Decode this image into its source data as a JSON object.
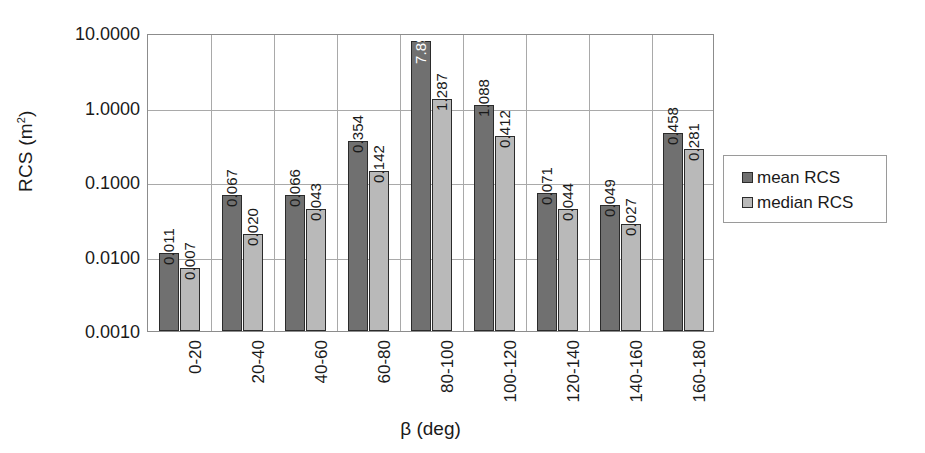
{
  "chart_data": {
    "type": "bar",
    "title": "",
    "xlabel": "β (deg)",
    "ylabel": "RCS (m²)",
    "yscale": "log",
    "ylim": [
      0.001,
      10.0
    ],
    "ytick_labels": [
      "10.0000",
      "1.0000",
      "0.1000",
      "0.0100",
      "0.0010"
    ],
    "ytick_values": [
      10.0,
      1.0,
      0.1,
      0.01,
      0.001
    ],
    "grid": true,
    "legend_position": "right",
    "categories": [
      "0-20",
      "20-40",
      "40-60",
      "60-80",
      "80-100",
      "100-120",
      "120-140",
      "140-160",
      "160-180"
    ],
    "series": [
      {
        "name": "mean RCS",
        "color": "#707070",
        "values": [
          0.011,
          0.067,
          0.066,
          0.354,
          7.895,
          1.088,
          0.071,
          0.049,
          0.458
        ],
        "labels": [
          "0.011",
          "0.067",
          "0.066",
          "0.354",
          "7.895",
          "1.088",
          "0.071",
          "0.049",
          "0.458"
        ]
      },
      {
        "name": "median RCS",
        "color": "#b9b9b9",
        "values": [
          0.007,
          0.02,
          0.043,
          0.142,
          1.287,
          0.412,
          0.044,
          0.027,
          0.281
        ],
        "labels": [
          "0.007",
          "0.020",
          "0.043",
          "0.142",
          "1.287",
          "0.412",
          "0.044",
          "0.027",
          "0.281"
        ]
      }
    ]
  },
  "legend": {
    "entries": [
      {
        "label": "mean RCS",
        "swatch": "mean"
      },
      {
        "label": "median RCS",
        "swatch": "median"
      }
    ]
  },
  "axis": {
    "y_title_main": "RCS (m",
    "y_title_sup": "2",
    "y_title_tail": ")",
    "x_title": "β (deg)"
  }
}
